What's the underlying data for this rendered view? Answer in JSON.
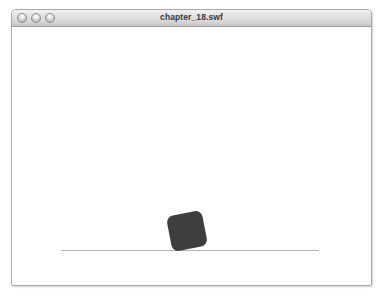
{
  "window": {
    "title": "chapter_18.swf",
    "controls": [
      {
        "name": "close",
        "label": ""
      },
      {
        "name": "minimize",
        "label": ""
      },
      {
        "name": "zoom",
        "label": ""
      }
    ]
  },
  "stage": {
    "background_color": "#ffffff",
    "ground": {
      "color": "#b3b3b3",
      "x1": 60,
      "x2": 318,
      "y": 241,
      "thickness": 1
    },
    "box": {
      "shape": "rounded-square",
      "color": "#3e3e3e",
      "x": 168,
      "y": 195,
      "width": 36,
      "height": 36,
      "corner_radius": 7,
      "rotation_deg": -11
    }
  }
}
